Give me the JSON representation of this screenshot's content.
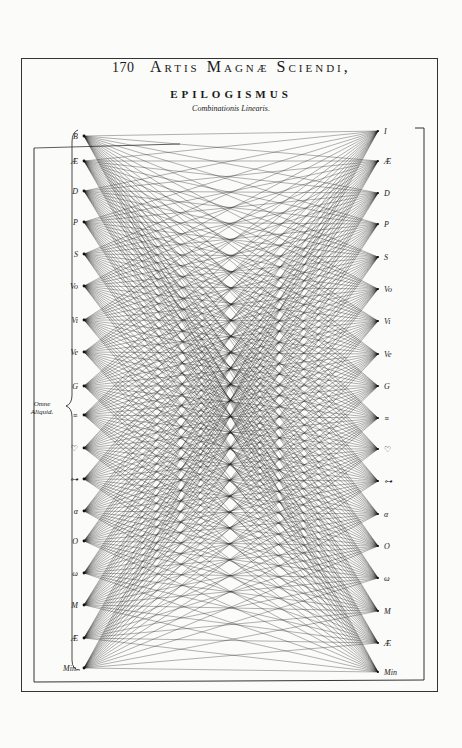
{
  "header": {
    "page_number": "170",
    "running_head": "Artis Magnæ Sciendi,",
    "title": "EPILOGISMUS",
    "subtitle": "Combinationis Linearis."
  },
  "brace_caption": {
    "line1": "Omne",
    "line2": "Aliquid."
  },
  "left_nodes": [
    {
      "label": "B",
      "y": 136
    },
    {
      "label": "Æ",
      "y": 161
    },
    {
      "label": "D",
      "y": 191
    },
    {
      "label": "P",
      "y": 222
    },
    {
      "label": "S",
      "y": 254
    },
    {
      "label": "Vo",
      "y": 286
    },
    {
      "label": "Vi",
      "y": 320
    },
    {
      "label": "Ve",
      "y": 352
    },
    {
      "label": "G",
      "y": 386
    },
    {
      "label": "≡",
      "y": 415
    },
    {
      "label": "♡",
      "y": 448
    },
    {
      "label": "⊶",
      "y": 479
    },
    {
      "label": "α",
      "y": 511
    },
    {
      "label": "O",
      "y": 541
    },
    {
      "label": "ω",
      "y": 573
    },
    {
      "label": "M",
      "y": 605
    },
    {
      "label": "Æ",
      "y": 638
    },
    {
      "label": "Min.",
      "y": 668
    }
  ],
  "right_nodes": [
    {
      "label": "I",
      "y": 131
    },
    {
      "label": "Æ",
      "y": 161
    },
    {
      "label": "D",
      "y": 193
    },
    {
      "label": "P",
      "y": 224
    },
    {
      "label": "S",
      "y": 257
    },
    {
      "label": "Vo",
      "y": 289
    },
    {
      "label": "Vi",
      "y": 321
    },
    {
      "label": "Ve",
      "y": 354
    },
    {
      "label": "G",
      "y": 386
    },
    {
      "label": "≡",
      "y": 418
    },
    {
      "label": "♡",
      "y": 449
    },
    {
      "label": "⊶",
      "y": 481
    },
    {
      "label": "α",
      "y": 514
    },
    {
      "label": "O",
      "y": 546
    },
    {
      "label": "ω",
      "y": 578
    },
    {
      "label": "M",
      "y": 611
    },
    {
      "label": "Æ",
      "y": 643
    },
    {
      "label": "Min",
      "y": 672
    }
  ],
  "diagram": {
    "left_x": 84,
    "right_x": 378,
    "line_color": "#1c1c1c"
  }
}
